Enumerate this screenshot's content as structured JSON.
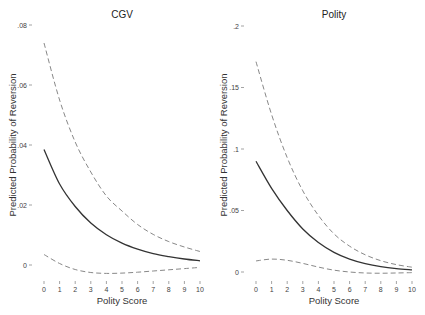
{
  "chart_data": [
    {
      "type": "line",
      "title": "CGV",
      "xlabel": "Polity Score",
      "ylabel": "Predicted Probability of Reversion",
      "x": [
        0,
        1,
        2,
        3,
        4,
        5,
        6,
        7,
        8,
        9,
        10
      ],
      "xticks": [
        "0",
        "1",
        "2",
        "3",
        "4",
        "5",
        "6",
        "7",
        "8",
        "9",
        "10"
      ],
      "yticks": [
        {
          "value": 0,
          "label": "0"
        },
        {
          "value": 0.02,
          "label": ".02"
        },
        {
          "value": 0.04,
          "label": ".04"
        },
        {
          "value": 0.06,
          "label": ".06"
        },
        {
          "value": 0.08,
          "label": ".08"
        }
      ],
      "ylim": [
        -0.004,
        0.08
      ],
      "grid": false,
      "series": [
        {
          "name": "Predicted probability",
          "style": "solid",
          "values": [
            0.0385,
            0.027,
            0.0195,
            0.014,
            0.0101,
            0.0073,
            0.0053,
            0.0038,
            0.0028,
            0.002,
            0.0014
          ]
        },
        {
          "name": "Upper 95% CI",
          "style": "dashed",
          "values": [
            0.074,
            0.055,
            0.041,
            0.031,
            0.023,
            0.018,
            0.0135,
            0.0102,
            0.0078,
            0.006,
            0.0045
          ]
        },
        {
          "name": "Lower 95% CI",
          "style": "dashed",
          "values": [
            0.0035,
            0.0005,
            -0.0015,
            -0.0025,
            -0.0028,
            -0.0027,
            -0.0024,
            -0.002,
            -0.0016,
            -0.0012,
            -0.0008
          ]
        }
      ],
      "layout": {
        "x0_px": 44,
        "x10_px": 200,
        "y_zero_px": 265,
        "y_top_px": 25,
        "y_top_value": 0.08
      }
    },
    {
      "type": "line",
      "title": "Polity",
      "xlabel": "Polity Score",
      "ylabel": "Predicted Probability of Reversion",
      "x": [
        0,
        1,
        2,
        3,
        4,
        5,
        6,
        7,
        8,
        9,
        10
      ],
      "xticks": [
        "0",
        "1",
        "2",
        "3",
        "4",
        "5",
        "6",
        "7",
        "8",
        "9",
        "10"
      ],
      "yticks": [
        {
          "value": 0,
          "label": "0"
        },
        {
          "value": 0.05,
          "label": ".05"
        },
        {
          "value": 0.1,
          "label": ".1"
        },
        {
          "value": 0.15,
          "label": ".15"
        },
        {
          "value": 0.2,
          "label": ".2"
        }
      ],
      "ylim": [
        -0.002,
        0.2
      ],
      "grid": false,
      "series": [
        {
          "name": "Predicted probability",
          "style": "solid",
          "values": [
            0.09,
            0.068,
            0.05,
            0.035,
            0.024,
            0.016,
            0.0105,
            0.0068,
            0.0043,
            0.0027,
            0.0017
          ]
        },
        {
          "name": "Upper 95% CI",
          "style": "dashed",
          "values": [
            0.171,
            0.128,
            0.093,
            0.066,
            0.046,
            0.031,
            0.021,
            0.014,
            0.0092,
            0.006,
            0.0039
          ]
        },
        {
          "name": "Lower 95% CI",
          "style": "dashed",
          "values": [
            0.009,
            0.0105,
            0.0095,
            0.007,
            0.004,
            0.0015,
            0.0,
            -0.0008,
            -0.001,
            -0.0008,
            -0.0005
          ]
        }
      ],
      "layout": {
        "x0_px": 256,
        "x10_px": 412,
        "y_zero_px": 272,
        "y_top_px": 26,
        "y_top_value": 0.2
      }
    }
  ],
  "colors": {
    "solid": "#333333",
    "dashed": "#888888",
    "text": "#333333"
  }
}
